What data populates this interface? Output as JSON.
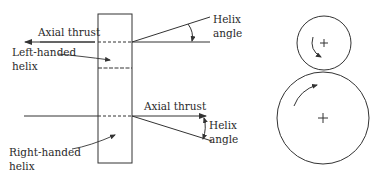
{
  "labels": {
    "axial_thrust_top": "Axial thrust",
    "left_handed_line1": "Left-handed",
    "left_handed_line2": "helix",
    "helix_angle_top_line1": "Helix",
    "helix_angle_top_line2": "angle",
    "axial_thrust_bottom": "Axial thrust",
    "helix_angle_bottom_line1": "Helix",
    "helix_angle_bottom_line2": "angle",
    "right_handed_line1": "Right-handed",
    "right_handed_line2": "helix"
  },
  "gear_pair": {
    "small_gear": {
      "cx": 324,
      "cy": 43,
      "r": 27,
      "rotation": "counterclockwise"
    },
    "large_gear": {
      "cx": 323,
      "cy": 118,
      "r": 46,
      "rotation": "clockwise"
    }
  },
  "colors": {
    "line": "#333333",
    "background": "#ffffff"
  }
}
